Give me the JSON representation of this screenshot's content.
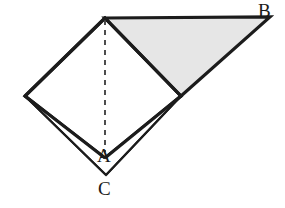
{
  "figure": {
    "canvas": {
      "width": 285,
      "height": 208,
      "background": "#ffffff"
    },
    "style": {
      "stroke_color": "#1c1c1c",
      "stroke_width_main": 3.2,
      "stroke_width_thin": 1.6,
      "dash_color": "#3a3a3a",
      "dash_width": 1.8,
      "dash_pattern": "5,5",
      "shade_fill": "#e6e6e6",
      "shade_stroke": "#1c1c1c",
      "unshaded_fill": "#ffffff"
    },
    "points": {
      "apex": {
        "name": "top-apex",
        "x": 105,
        "y": 18
      },
      "B": {
        "name": "vertex-B",
        "x": 270,
        "y": 17
      },
      "right": {
        "name": "square-right-vertex",
        "x": 181,
        "y": 96
      },
      "left": {
        "name": "square-left-vertex",
        "x": 25,
        "y": 96
      },
      "A": {
        "name": "vertex-A",
        "x": 105,
        "y": 158
      },
      "C": {
        "name": "vertex-C",
        "x": 106,
        "y": 175
      }
    },
    "shapes": {
      "square_polygon": "105,18 181,96 105,158 25,96",
      "shaded_triangle": "105,18 270,17 181,96",
      "flap_polygon": "25,96 106,175 181,96 105,158",
      "dashed_segment": {
        "x1": 105,
        "y1": 20,
        "x2": 105,
        "y2": 152
      }
    },
    "labels": {
      "A": "A",
      "B": "B",
      "C": "C"
    }
  }
}
